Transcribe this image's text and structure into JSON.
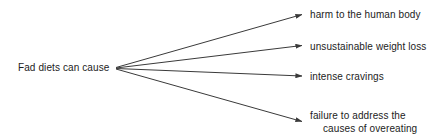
{
  "diagram": {
    "type": "cause-effect-fan",
    "background_color": "#ffffff",
    "line_color": "#3a3a3a",
    "text_color": "#1c1c1c",
    "source": {
      "label": "Fad diets can cause"
    },
    "targets": [
      {
        "label": "harm to the human body",
        "line1": "harm to the human body",
        "line2": ""
      },
      {
        "label": "unsustainable weight loss",
        "line1": "unsustainable weight loss",
        "line2": ""
      },
      {
        "label": "intense cravings",
        "line1": "intense cravings",
        "line2": ""
      },
      {
        "label": "failure to address the causes of overeating",
        "line1": "failure to address the",
        "line2": "causes of overeating"
      }
    ]
  }
}
